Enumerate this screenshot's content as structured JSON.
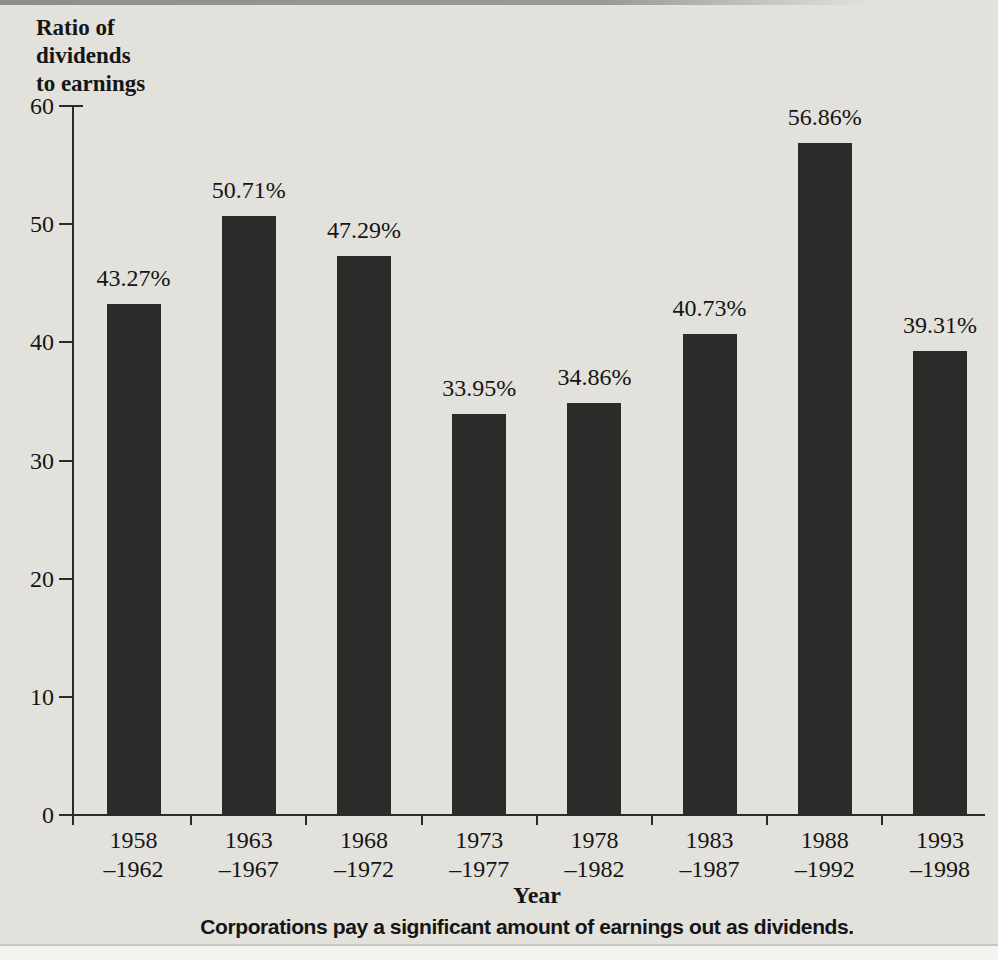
{
  "figure": {
    "background_color": "#e2e1dc",
    "bar_color": "#2d2b29",
    "text_color": "#151515",
    "axis_color": "#2b2b2b"
  },
  "chart_data": {
    "type": "bar",
    "title": "Ratio of dividends to earnings",
    "title_lines": [
      "Ratio of",
      "dividends",
      "to earnings"
    ],
    "xlabel": "Year",
    "ylabel": "Ratio of dividends to earnings",
    "caption": "Corporations pay a significant amount of earnings out as dividends.",
    "ylim": [
      0,
      60
    ],
    "yticks": [
      0,
      10,
      20,
      30,
      40,
      50,
      60
    ],
    "grid": false,
    "legend": false,
    "categories": [
      {
        "line1": "1958",
        "line2": "–1962"
      },
      {
        "line1": "1963",
        "line2": "–1967"
      },
      {
        "line1": "1968",
        "line2": "–1972"
      },
      {
        "line1": "1973",
        "line2": "–1977"
      },
      {
        "line1": "1978",
        "line2": "–1982"
      },
      {
        "line1": "1983",
        "line2": "–1987"
      },
      {
        "line1": "1988",
        "line2": "–1992"
      },
      {
        "line1": "1993",
        "line2": "–1998"
      }
    ],
    "values": [
      43.27,
      50.71,
      47.29,
      33.95,
      34.86,
      40.73,
      56.86,
      39.31
    ],
    "value_labels": [
      "43.27%",
      "50.71%",
      "47.29%",
      "33.95%",
      "34.86%",
      "40.73%",
      "56.86%",
      "39.31%"
    ]
  }
}
